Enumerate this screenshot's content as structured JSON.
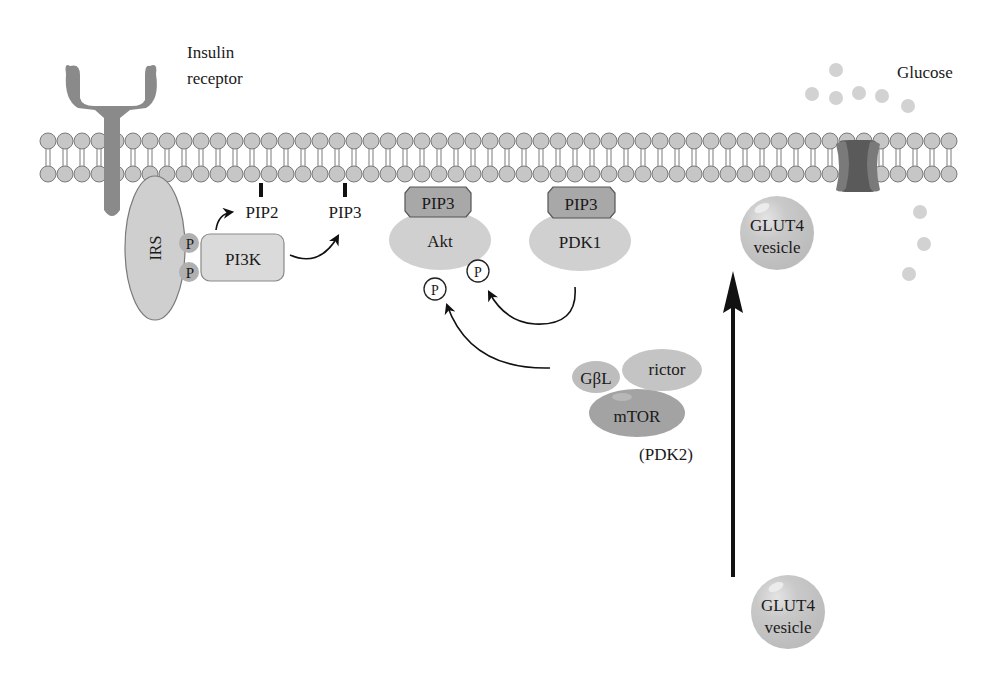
{
  "diagram": {
    "colors": {
      "membrane_head_fill": "#c6c6c6",
      "membrane_head_stroke": "#7a7a7a",
      "receptor": "#8a8a8a",
      "irs_fill": "#cfcfcf",
      "pi3k_fill": "#dadada",
      "akt_fill": "#d0d0d0",
      "pip3_box": "#a8a8a8",
      "mtor_fill": "#a3a3a3",
      "gbl_fill": "#bdbdbd",
      "rictor_fill": "#c4c4c4",
      "glut4_fill": "#c8c8c8",
      "glucose_fill": "#d2d2d2",
      "channel_dark": "#5a5a5a",
      "arrow": "#111111"
    },
    "labels": {
      "insulin_receptor_line1": "Insulin",
      "insulin_receptor_line2": "receptor",
      "glucose": "Glucose",
      "irs": "IRS",
      "p_top": "P",
      "p_bottom": "P",
      "pi3k": "PI3K",
      "pip2": "PIP2",
      "pip3_free": "PIP3",
      "pip3_akt": "PIP3",
      "akt": "Akt",
      "pip3_pdk1": "PIP3",
      "pdk1": "PDK1",
      "phospho_1": "P",
      "phospho_2": "P",
      "gbl": "GβL",
      "rictor": "rictor",
      "mtor": "mTOR",
      "pdk2": "(PDK2)",
      "glut4_upper_line1": "GLUT4",
      "glut4_upper_line2": "vesicle",
      "glut4_lower_line1": "GLUT4",
      "glut4_lower_line2": "vesicle"
    },
    "nodes": [
      {
        "id": "insulin-receptor",
        "label": "Insulin receptor"
      },
      {
        "id": "irs",
        "label": "IRS"
      },
      {
        "id": "pi3k",
        "label": "PI3K"
      },
      {
        "id": "pip2",
        "label": "PIP2"
      },
      {
        "id": "pip3",
        "label": "PIP3"
      },
      {
        "id": "akt",
        "label": "Akt"
      },
      {
        "id": "pdk1",
        "label": "PDK1"
      },
      {
        "id": "mtorc2",
        "label": "GβL / rictor / mTOR (PDK2)"
      },
      {
        "id": "glut4-vesicle",
        "label": "GLUT4 vesicle"
      },
      {
        "id": "glut4-channel",
        "label": "GLUT4 transporter"
      },
      {
        "id": "glucose",
        "label": "Glucose"
      }
    ],
    "edges": [
      {
        "from": "pi3k",
        "to": "pip2",
        "type": "curved-arrow"
      },
      {
        "from": "pi3k",
        "to": "pip3",
        "type": "curved-arrow"
      },
      {
        "from": "pdk1",
        "to": "akt",
        "type": "phosphorylation"
      },
      {
        "from": "mtorc2",
        "to": "akt",
        "type": "phosphorylation"
      },
      {
        "from": "glut4-vesicle",
        "to": "membrane",
        "type": "translocation"
      }
    ]
  }
}
